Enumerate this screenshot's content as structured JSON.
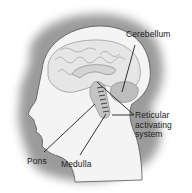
{
  "diagram": {
    "colors": {
      "background": "#ffffff",
      "halo": "#8a8a8a",
      "head_fill": "#f4f4f4",
      "brain_fill": "#e6e6e6",
      "brain_stroke": "#9a9a9a",
      "cerebellum_fill": "#bdbdbd",
      "brainstem_fill": "#c4c4c4",
      "leader_line": "#1e1e1e",
      "text": "#222222"
    },
    "labels": {
      "cerebellum": "Cerebellum",
      "reticular_line1": "Reticular",
      "reticular_line2": "activating",
      "reticular_line3": "system",
      "pons": "Pons",
      "medulla": "Medulla"
    }
  }
}
